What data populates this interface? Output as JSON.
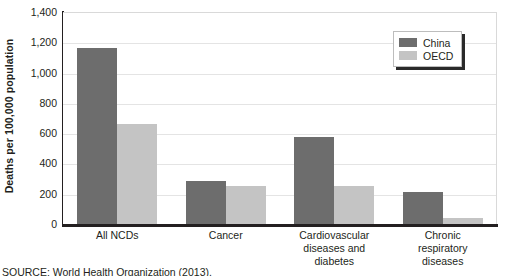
{
  "chart_data": {
    "type": "bar",
    "title": "",
    "subtitle": "",
    "xlabel": "",
    "ylabel": "Deaths per 100,000 population",
    "ylim": [
      0,
      1400
    ],
    "yticks": [
      "0",
      "200",
      "400",
      "600",
      "800",
      "1,000",
      "1,200",
      "1,400"
    ],
    "ytick_values": [
      0,
      200,
      400,
      600,
      800,
      1000,
      1200,
      1400
    ],
    "grid": true,
    "legend_position": "top-right",
    "categories": [
      "All NCDs",
      "Cancer",
      "Cardiovascular diseases and diabetes",
      "Chronic respiratory diseases"
    ],
    "category_label_lines": [
      [
        "All NCDs"
      ],
      [
        "Cancer"
      ],
      [
        "Cardiovascular",
        "diseases and",
        "diabetes"
      ],
      [
        "Chronic",
        "respiratory",
        "diseases"
      ]
    ],
    "series": [
      {
        "name": "China",
        "color": "#6d6d6d",
        "values": [
          1160,
          285,
          575,
          210
        ]
      },
      {
        "name": "OECD",
        "color": "#c4c4c4",
        "values": [
          660,
          250,
          250,
          40
        ]
      }
    ]
  },
  "legend": {
    "items": [
      {
        "label": "China",
        "color": "#6d6d6d"
      },
      {
        "label": "OECD",
        "color": "#c4c4c4"
      }
    ]
  },
  "source": {
    "text": "SOURCE: World Health Organization (2013)."
  },
  "colors": {
    "china": "#6d6d6d",
    "oecd": "#c4c4c4",
    "axis": "#231f20",
    "gridline": "#e4e4e4",
    "plot_border": "#d9d9d9"
  }
}
